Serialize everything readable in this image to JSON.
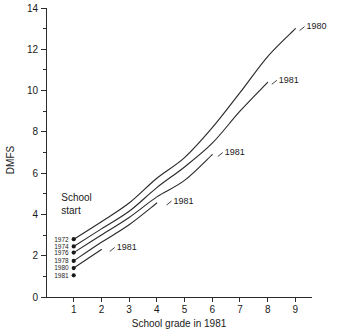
{
  "chart_data": {
    "type": "line",
    "title": "",
    "xlabel": "School grade in 1981",
    "ylabel": "DMFS",
    "xlim": [
      0,
      9.6
    ],
    "ylim": [
      0,
      14
    ],
    "grid": false,
    "legend_position": "inline-end-labels",
    "x_ticks": [
      1,
      2,
      3,
      4,
      5,
      6,
      7,
      8,
      9
    ],
    "x_tick_labels": [
      "1",
      "2",
      "3",
      "4",
      "5",
      "6",
      "7",
      "8",
      "9"
    ],
    "y_ticks": [
      0,
      2,
      4,
      6,
      8,
      10,
      12,
      14
    ],
    "y_tick_labels": [
      "0",
      "2",
      "4",
      "6",
      "8",
      "10",
      "12",
      "14"
    ],
    "y_minor_ticks": [
      1,
      3,
      5,
      7,
      9,
      11,
      13
    ],
    "annotations": [
      {
        "text": "School",
        "x": 0.55,
        "y": 4.65
      },
      {
        "text": "start",
        "x": 0.55,
        "y": 4.0
      }
    ],
    "series": [
      {
        "name": "1972",
        "start_label": "1972",
        "end_label": "1980",
        "x": [
          1,
          2,
          3,
          4,
          5,
          6,
          7,
          8,
          9
        ],
        "values": [
          2.8,
          3.65,
          4.55,
          5.75,
          6.75,
          8.2,
          9.9,
          11.65,
          13.0
        ]
      },
      {
        "name": "1974",
        "start_label": "1974",
        "end_label": "1981",
        "x": [
          1,
          2,
          3,
          4,
          5,
          6,
          7,
          8
        ],
        "values": [
          2.45,
          3.3,
          4.15,
          5.3,
          6.3,
          7.45,
          9.0,
          10.4
        ]
      },
      {
        "name": "1976",
        "start_label": "1976",
        "end_label": "1981",
        "x": [
          1,
          2,
          3,
          4,
          5,
          6
        ],
        "values": [
          2.15,
          3.0,
          3.85,
          4.85,
          5.65,
          6.9
        ]
      },
      {
        "name": "1978",
        "start_label": "1978",
        "end_label": "1981",
        "x": [
          1,
          2,
          3,
          4
        ],
        "values": [
          1.75,
          2.65,
          3.5,
          4.55
        ]
      },
      {
        "name": "1980",
        "start_label": "1980",
        "end_label": "1981",
        "x": [
          1,
          2
        ],
        "values": [
          1.4,
          2.3
        ]
      },
      {
        "name": "1981",
        "start_label": "1981",
        "end_label": "",
        "x": [
          1
        ],
        "values": [
          1.05
        ]
      }
    ],
    "end_labels": [
      {
        "text": "1980",
        "x": 9.15,
        "y": 13.05
      },
      {
        "text": "1981",
        "x": 8.15,
        "y": 10.45
      },
      {
        "text": "1981",
        "x": 6.2,
        "y": 6.95
      },
      {
        "text": "1981",
        "x": 4.35,
        "y": 4.6
      },
      {
        "text": "1981",
        "x": 2.3,
        "y": 2.35
      }
    ],
    "colors": {
      "line": "#2b2b2b",
      "axis": "#2b2b2b",
      "text": "#1a1a1a",
      "background": "#ffffff"
    }
  }
}
